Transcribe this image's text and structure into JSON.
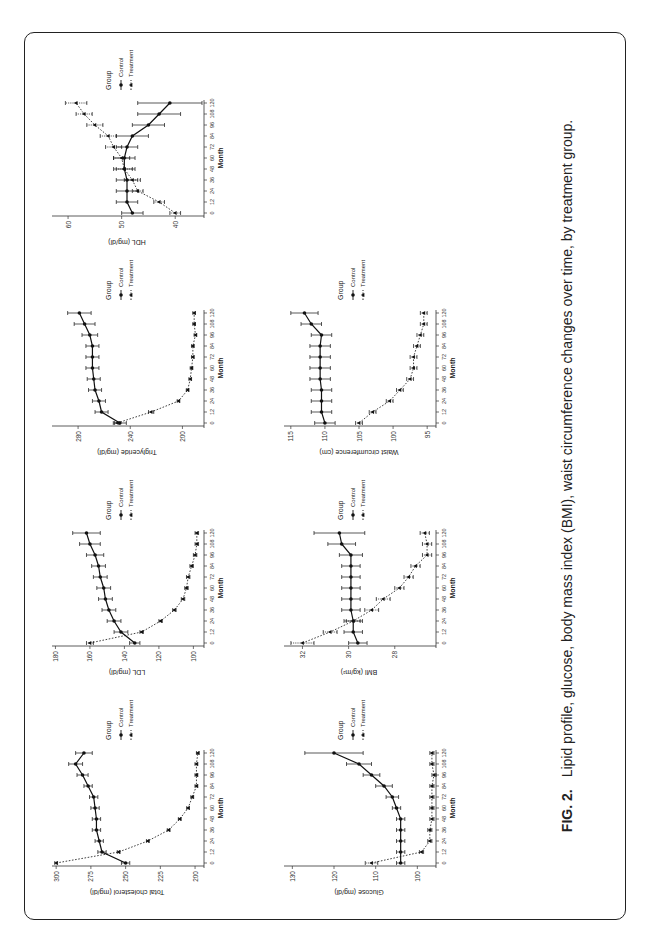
{
  "caption": {
    "label": "FIG. 2.",
    "text": "Lipid profile, glucose, body mass index (BMI), waist circumference changes over time, by treatment group."
  },
  "legend": {
    "title": "Group",
    "items": [
      "Control",
      "Treatment"
    ]
  },
  "chart_data": [
    {
      "type": "line",
      "title": "Total cholesterol",
      "xlabel": "Month",
      "ylabel": "Total cholesterol (mg/dl)",
      "x": [
        0,
        12,
        24,
        36,
        48,
        60,
        72,
        84,
        96,
        108,
        120
      ],
      "xticks": [
        0,
        12,
        24,
        36,
        48,
        60,
        72,
        84,
        96,
        108,
        120
      ],
      "yticks": [
        200,
        225,
        250,
        275,
        300
      ],
      "ylim": [
        195,
        303
      ],
      "series": [
        {
          "name": "Control",
          "values": [
            250,
            267,
            269,
            271,
            271,
            272,
            273,
            277,
            281,
            286,
            280
          ],
          "err": [
            3,
            3,
            3,
            3,
            3,
            3,
            3,
            3,
            4,
            5,
            6
          ]
        },
        {
          "name": "Treatment",
          "values": [
            300,
            255,
            234,
            219,
            211,
            205,
            202,
            199,
            199,
            199,
            198
          ],
          "err": [
            1,
            1,
            1,
            1,
            1,
            1,
            1,
            1,
            1,
            1,
            1
          ]
        }
      ],
      "legend_position": "right"
    },
    {
      "type": "line",
      "title": "LDL",
      "xlabel": "Month",
      "ylabel": "LDL (mg/dl)",
      "x": [
        0,
        12,
        24,
        36,
        48,
        60,
        72,
        84,
        96,
        108,
        120
      ],
      "xticks": [
        0,
        12,
        24,
        36,
        48,
        60,
        72,
        84,
        96,
        108,
        120
      ],
      "yticks": [
        100,
        120,
        140,
        160,
        180
      ],
      "ylim": [
        95,
        182
      ],
      "series": [
        {
          "name": "Control",
          "values": [
            134,
            142,
            146,
            149,
            151,
            152,
            154,
            155,
            157,
            160,
            162
          ],
          "err": [
            3,
            4,
            4,
            4,
            4,
            4,
            4,
            4,
            5,
            6,
            8
          ]
        },
        {
          "name": "Treatment",
          "values": [
            160,
            130,
            119,
            111,
            106,
            104,
            103,
            101,
            99,
            98,
            98
          ],
          "err": [
            2,
            1,
            1,
            1,
            1,
            1,
            1,
            1,
            1,
            1,
            1
          ]
        }
      ],
      "legend_position": "right"
    },
    {
      "type": "line",
      "title": "Triglyceride",
      "xlabel": "Month",
      "ylabel": "Triglyceride (mg/dl)",
      "x": [
        0,
        12,
        24,
        36,
        48,
        60,
        72,
        84,
        96,
        108,
        120
      ],
      "xticks": [
        0,
        12,
        24,
        36,
        48,
        60,
        72,
        84,
        96,
        108,
        120
      ],
      "yticks": [
        200,
        240,
        280
      ],
      "ylim": [
        185,
        300
      ],
      "series": [
        {
          "name": "Control",
          "values": [
            248,
            262,
            264,
            267,
            268,
            269,
            269,
            269,
            271,
            275,
            279
          ],
          "err": [
            5,
            5,
            5,
            5,
            5,
            5,
            5,
            5,
            6,
            8,
            9
          ]
        },
        {
          "name": "Treatment",
          "values": [
            250,
            224,
            203,
            196,
            194,
            193,
            192,
            192,
            190,
            191,
            191
          ],
          "err": [
            2,
            2,
            1,
            1,
            1,
            1,
            1,
            1,
            1,
            1,
            1
          ]
        }
      ],
      "legend_position": "right"
    },
    {
      "type": "line",
      "title": "HDL",
      "xlabel": "Month",
      "ylabel": "HDL (mg/dl)",
      "x": [
        0,
        12,
        24,
        36,
        48,
        60,
        72,
        84,
        96,
        108,
        120
      ],
      "xticks": [
        0,
        12,
        24,
        36,
        48,
        60,
        72,
        84,
        96,
        108,
        120
      ],
      "yticks": [
        40,
        50,
        60
      ],
      "ylim": [
        35,
        63
      ],
      "series": [
        {
          "name": "Control",
          "values": [
            48,
            49,
            49,
            49,
            49.5,
            49.5,
            49,
            48,
            45,
            43,
            41
          ],
          "err": [
            2,
            2,
            2,
            2,
            2,
            2,
            2,
            3,
            3,
            4,
            6
          ]
        },
        {
          "name": "Treatment",
          "values": [
            40,
            43,
            47,
            48,
            49.5,
            50,
            51.5,
            52.5,
            55,
            57,
            58.5
          ],
          "err": [
            1,
            1,
            1,
            1.5,
            1.5,
            1.5,
            1.5,
            1.5,
            1.5,
            1.5,
            2
          ]
        }
      ],
      "legend_position": "right"
    },
    {
      "type": "line",
      "title": "Glucose",
      "xlabel": "Month",
      "ylabel": "Glucose (mg/dl)",
      "x": [
        0,
        12,
        24,
        36,
        48,
        60,
        72,
        84,
        96,
        108,
        120
      ],
      "xticks": [
        0,
        12,
        24,
        36,
        48,
        60,
        72,
        84,
        96,
        108,
        120
      ],
      "yticks": [
        100,
        110,
        120,
        130
      ],
      "ylim": [
        96,
        132
      ],
      "series": [
        {
          "name": "Control",
          "values": [
            104,
            104,
            104,
            104,
            104,
            105,
            106,
            108,
            111,
            114,
            120
          ],
          "err": [
            1,
            1,
            1,
            1,
            1,
            1,
            1.5,
            2,
            2,
            3,
            7
          ]
        },
        {
          "name": "Treatment",
          "values": [
            111,
            99,
            97,
            97,
            96.5,
            96.5,
            96.5,
            96.5,
            96,
            96.5,
            96.5
          ],
          "err": [
            1.5,
            0.5,
            0.5,
            0.5,
            0.5,
            0.5,
            0.5,
            0.5,
            0.5,
            0.5,
            0.5
          ]
        }
      ],
      "legend_position": "right"
    },
    {
      "type": "line",
      "title": "BMI",
      "xlabel": "Month",
      "ylabel": "BMI (kg/m²)",
      "x": [
        0,
        12,
        24,
        36,
        48,
        60,
        72,
        84,
        96,
        108,
        120
      ],
      "xticks": [
        0,
        12,
        24,
        36,
        48,
        60,
        72,
        84,
        96,
        108,
        120
      ],
      "yticks": [
        28,
        30,
        32
      ],
      "ylim": [
        26.3,
        32.8
      ],
      "series": [
        {
          "name": "Control",
          "values": [
            29.6,
            29.8,
            29.8,
            29.9,
            29.9,
            29.9,
            29.9,
            29.9,
            29.9,
            30.3,
            30.4
          ],
          "err": [
            0.4,
            0.4,
            0.4,
            0.4,
            0.4,
            0.4,
            0.4,
            0.4,
            0.5,
            0.6,
            1.1
          ]
        },
        {
          "name": "Treatment",
          "values": [
            32.0,
            30.8,
            29.8,
            29.0,
            28.5,
            27.8,
            27.4,
            27.1,
            26.6,
            26.6,
            26.7
          ],
          "err": [
            0.5,
            0.3,
            0.3,
            0.3,
            0.3,
            0.2,
            0.2,
            0.2,
            0.2,
            0.2,
            0.2
          ]
        }
      ],
      "legend_position": "right"
    },
    {
      "type": "line",
      "title": "Waist circumference",
      "xlabel": "Month",
      "ylabel": "Waist circumference (cm)",
      "x": [
        0,
        12,
        24,
        36,
        48,
        60,
        72,
        84,
        96,
        108,
        120
      ],
      "xticks": [
        0,
        12,
        24,
        36,
        48,
        60,
        72,
        84,
        96,
        108,
        120
      ],
      "yticks": [
        95,
        100,
        105,
        110,
        115
      ],
      "ylim": [
        94,
        116
      ],
      "series": [
        {
          "name": "Control",
          "values": [
            110,
            110.5,
            110.5,
            110.5,
            110.7,
            110.7,
            110.7,
            110.7,
            110.5,
            112,
            113
          ],
          "err": [
            1.5,
            1.5,
            1.5,
            1.5,
            1.5,
            1.5,
            1.5,
            1.5,
            1.5,
            1.5,
            2
          ]
        },
        {
          "name": "Treatment",
          "values": [
            105,
            103,
            100.5,
            99,
            97.5,
            97,
            97,
            96.5,
            96,
            95.5,
            95.5
          ],
          "err": [
            0.5,
            0.5,
            0.5,
            0.5,
            0.5,
            0.5,
            0.5,
            0.5,
            0.5,
            0.5,
            0.5
          ]
        }
      ],
      "legend_position": "right"
    }
  ]
}
